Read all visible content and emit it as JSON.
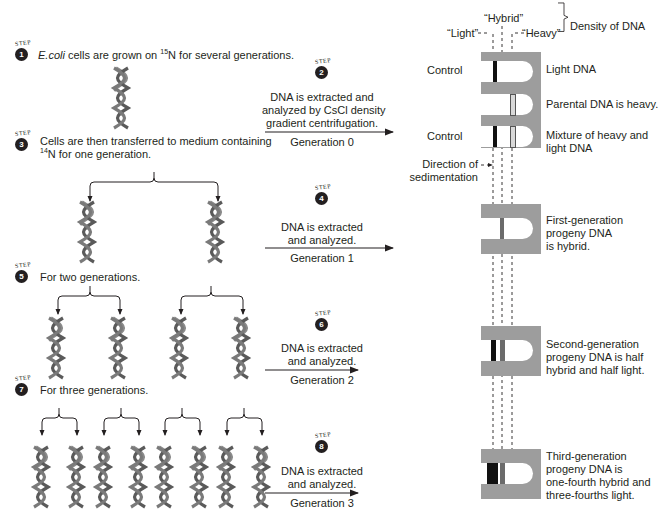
{
  "steps": [
    {
      "number": "1",
      "label": "STEP",
      "text_pre": "",
      "italic": "E.coli",
      "text_mid": " cells are grown on ",
      "sup": "15",
      "text_post": "N for several generations."
    },
    {
      "number": "2",
      "label": "STEP",
      "lines": [
        "DNA is extracted and",
        "analyzed by CsCl density",
        "gradient centrifugation."
      ],
      "generation": "Generation 0"
    },
    {
      "number": "3",
      "label": "STEP",
      "line1": "Cells are then transferred to medium containing",
      "sup": "14",
      "line2_post": "N  for one generation."
    },
    {
      "number": "4",
      "label": "STEP",
      "lines": [
        "DNA is extracted",
        "and analyzed."
      ],
      "generation": "Generation 1"
    },
    {
      "number": "5",
      "label": "STEP",
      "text": "For two generations."
    },
    {
      "number": "6",
      "label": "STEP",
      "lines": [
        "DNA is extracted",
        "and analyzed."
      ],
      "generation": "Generation 2"
    },
    {
      "number": "7",
      "label": "STEP",
      "text": "For three generations."
    },
    {
      "number": "8",
      "label": "STEP",
      "lines": [
        "DNA is extracted",
        "and analyzed."
      ],
      "generation": "Generation 3"
    }
  ],
  "density_legend": {
    "light": "“Light”",
    "hybrid": "“Hybrid”",
    "heavy": "“Heavy”",
    "title": "Density of DNA"
  },
  "tubes": {
    "control_label": "Control",
    "sedimentation_label": [
      "Direction of",
      "sedimentation"
    ],
    "results": [
      {
        "lines": [
          "Light DNA"
        ]
      },
      {
        "lines": [
          "Parental DNA is heavy."
        ]
      },
      {
        "lines": [
          "Mixture of heavy and",
          "light DNA"
        ]
      },
      {
        "lines": [
          "First-generation",
          "progeny DNA",
          "is hybrid."
        ]
      },
      {
        "lines": [
          "Second-generation",
          "progeny DNA is half",
          "hybrid and half light."
        ]
      },
      {
        "lines": [
          "Third-generation",
          "progeny DNA is",
          "one-fourth hybrid and",
          "three-fourths light."
        ]
      }
    ]
  },
  "colors": {
    "tube_bg": "#9d9d9d",
    "light_band": "#111111",
    "hybrid_band": "#6b6b6b",
    "heavy_band": "#d8d8d8",
    "strand_dark": "#5a5a5a",
    "strand_light": "#8a8a8a"
  }
}
